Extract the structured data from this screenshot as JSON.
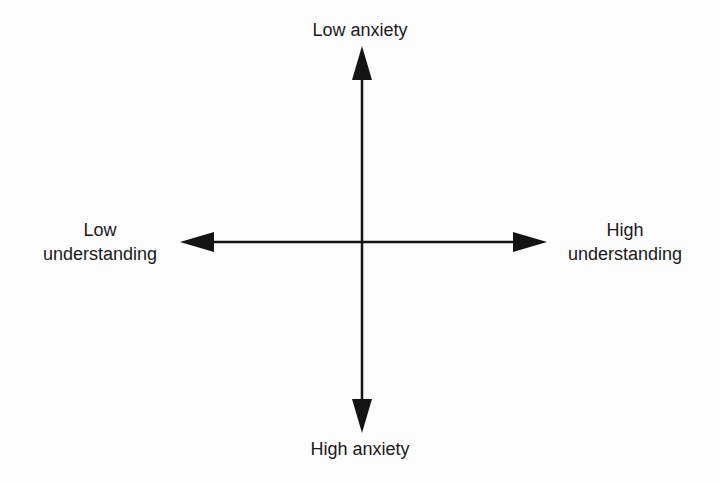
{
  "diagram": {
    "type": "quadrant-axes",
    "vertical_axis": {
      "top_label": "Low anxiety",
      "bottom_label": "High anxiety"
    },
    "horizontal_axis": {
      "left_label_lines": [
        "Low",
        "understanding"
      ],
      "right_label_lines": [
        "High",
        "understanding"
      ]
    },
    "colors": {
      "background": "#fcfcfc",
      "stroke": "#141414",
      "text": "#1a1a1a"
    }
  }
}
